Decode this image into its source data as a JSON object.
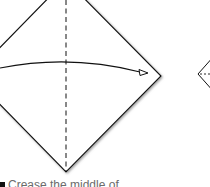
{
  "diagram": {
    "colors": {
      "stroke": "#111111",
      "shadow": "#9a9a9a",
      "background": "#ffffff",
      "caption": "#6b6b6b"
    },
    "shapes": [
      {
        "name": "square-paper-diamond",
        "vertices": {
          "top": [
            66,
            -20
          ],
          "left": [
            -28,
            76
          ],
          "right": [
            161,
            76
          ],
          "bottom": [
            66,
            172
          ]
        }
      },
      {
        "name": "crease-line-vertical",
        "style": "dashed",
        "x": 66
      },
      {
        "name": "fold-arrow",
        "from": [
          0,
          68
        ],
        "to": [
          148,
          73
        ],
        "direction": "left-to-right"
      },
      {
        "name": "next-step-diamond-partial",
        "left_vertex": [
          198,
          74
        ]
      }
    ]
  },
  "caption": {
    "step_marker": "■",
    "text": "Crease the middle of"
  }
}
